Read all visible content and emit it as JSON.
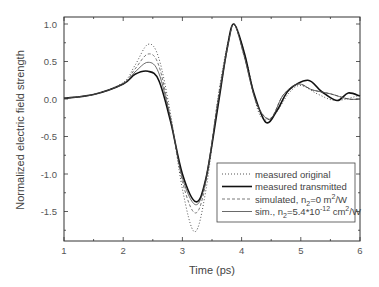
{
  "chart_data": {
    "type": "line",
    "title": "",
    "xlabel": "Time (ps)",
    "ylabel": "Normalized electric field strength",
    "xlim": [
      1,
      6
    ],
    "ylim": [
      -1.9,
      1.1
    ],
    "xticks": [
      1,
      2,
      3,
      4,
      5,
      6
    ],
    "xtick_labels": [
      "1",
      "2",
      "3",
      "4",
      "5",
      "6"
    ],
    "yticks": [
      1.0,
      0.5,
      0.0,
      -0.5,
      -1.0,
      -1.5
    ],
    "ytick_labels": [
      "1.0",
      "0.5",
      "0.0",
      "-0.5",
      "-1.0",
      "-1.5"
    ],
    "grid": false,
    "legend_position": "lower right",
    "series": [
      {
        "name": "measured original",
        "style": "dotted",
        "x": [
          1.0,
          1.5,
          2.0,
          2.2,
          2.42,
          2.6,
          2.8,
          3.0,
          3.21,
          3.4,
          3.6,
          3.78,
          3.9,
          4.1,
          4.3,
          4.52,
          4.8,
          5.0,
          5.3,
          5.6,
          6.0
        ],
        "y": [
          0.01,
          0.06,
          0.22,
          0.45,
          0.73,
          0.55,
          -0.2,
          -1.2,
          -1.77,
          -1.2,
          0.0,
          0.8,
          0.98,
          0.45,
          -0.2,
          -0.24,
          0.08,
          0.18,
          0.06,
          -0.02,
          0.05
        ]
      },
      {
        "name": "measured transmitted",
        "style": "thick-solid",
        "x": [
          1.0,
          1.5,
          2.0,
          2.2,
          2.42,
          2.6,
          2.8,
          3.0,
          3.23,
          3.4,
          3.6,
          3.75,
          3.87,
          4.05,
          4.2,
          4.41,
          4.6,
          4.8,
          5.12,
          5.35,
          5.61,
          5.8,
          6.0
        ],
        "y": [
          0.01,
          0.06,
          0.2,
          0.33,
          0.37,
          0.25,
          -0.3,
          -1.0,
          -1.37,
          -1.05,
          -0.1,
          0.65,
          1.0,
          0.6,
          0.1,
          -0.31,
          -0.15,
          0.12,
          0.25,
          0.1,
          -0.02,
          0.08,
          0.04
        ]
      },
      {
        "name": "simulated, n2=0 m^2/W",
        "style": "dashed",
        "x": [
          1.0,
          1.5,
          2.0,
          2.2,
          2.42,
          2.6,
          2.8,
          3.0,
          3.22,
          3.4,
          3.6,
          3.78,
          3.88,
          4.05,
          4.25,
          4.48,
          4.7,
          4.95,
          5.2,
          5.5,
          5.8,
          6.0
        ],
        "y": [
          0.01,
          0.06,
          0.21,
          0.4,
          0.6,
          0.45,
          -0.25,
          -1.1,
          -1.52,
          -1.1,
          0.0,
          0.78,
          0.99,
          0.55,
          -0.05,
          -0.26,
          0.05,
          0.2,
          0.12,
          0.07,
          0.0,
          0.0
        ]
      },
      {
        "name": "sim., n2=5.4*10^-12 cm^2/W",
        "style": "thin-solid",
        "x": [
          1.0,
          1.5,
          2.0,
          2.2,
          2.42,
          2.6,
          2.8,
          3.0,
          3.23,
          3.4,
          3.6,
          3.78,
          3.88,
          4.05,
          4.25,
          4.48,
          4.7,
          4.95,
          5.2,
          5.5,
          5.8,
          6.0
        ],
        "y": [
          0.01,
          0.06,
          0.2,
          0.36,
          0.49,
          0.35,
          -0.27,
          -1.05,
          -1.41,
          -1.05,
          -0.05,
          0.75,
          0.99,
          0.55,
          -0.05,
          -0.27,
          0.05,
          0.2,
          0.12,
          0.07,
          0.0,
          0.0
        ]
      }
    ]
  },
  "legend": {
    "items": [
      {
        "text": "measured original"
      },
      {
        "text": "measured transmitted"
      },
      {
        "main": "simulated, n",
        "sub": "2",
        "rest": "=0 m",
        "sup": "2",
        "tail": "/W"
      },
      {
        "main": "sim., n",
        "sub": "2",
        "rest": "=5.4*10",
        "sup1": "-12",
        "mid": " cm",
        "sup2": "2",
        "tail": "/W"
      }
    ]
  }
}
